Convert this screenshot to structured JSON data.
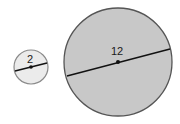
{
  "diagram": {
    "small_circle": {
      "label": "2",
      "fill": "#ebebeb",
      "stroke": "#8a8a8a",
      "center": [
        31,
        67
      ],
      "radius": 17
    },
    "large_circle": {
      "label": "12",
      "fill": "#c8c8c8",
      "stroke": "#555555",
      "center": [
        118,
        62
      ],
      "radius": 54
    }
  }
}
